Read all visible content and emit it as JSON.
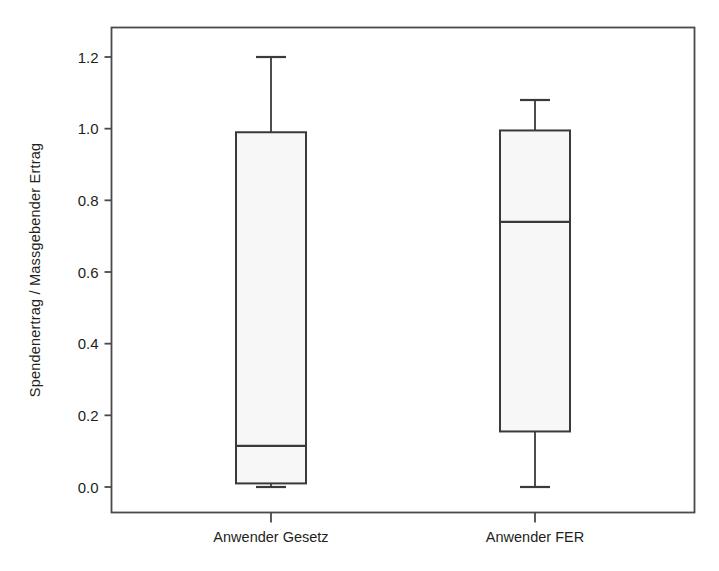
{
  "chart_data": {
    "type": "box",
    "title": "",
    "xlabel": "",
    "ylabel": "Spendenertrag / Massgebender Ertrag",
    "categories": [
      "Anwender Gesetz",
      "Anwender FER"
    ],
    "ylim": [
      -0.06,
      1.26
    ],
    "yticks": [
      0.0,
      0.2,
      0.4,
      0.6,
      0.8,
      1.0,
      1.2
    ],
    "ytick_labels": [
      "0.0",
      "0.2",
      "0.4",
      "0.6",
      "0.8",
      "1.0",
      "1.2"
    ],
    "grid": false,
    "legend": "none",
    "boxes": [
      {
        "category": "Anwender Gesetz",
        "whisker_low": 0.0,
        "q1": 0.01,
        "median": 0.115,
        "q3": 0.99,
        "whisker_high": 1.2
      },
      {
        "category": "Anwender FER",
        "whisker_low": 0.0,
        "q1": 0.155,
        "median": 0.74,
        "q3": 0.995,
        "whisker_high": 1.08
      }
    ],
    "colors": {
      "line": "#3a3a3a",
      "box_fill": "#f7f7f7",
      "frame": "#4a4a4a",
      "text": "#231f20",
      "background": "#ffffff"
    }
  }
}
